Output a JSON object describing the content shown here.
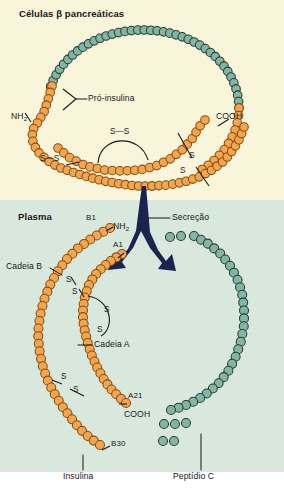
{
  "figure": {
    "type": "biology-diagram",
    "width": 284,
    "height": 494
  },
  "colors": {
    "panel_top_bg": "#f9f5da",
    "panel_bottom_bg": "#d9e8dc",
    "bead_orange_fill": "#f2a74e",
    "bead_orange_stroke": "#8a4b12",
    "bead_green_fill": "#7fb7a4",
    "bead_green_stroke": "#2f3a33",
    "arrow": "#1b2350",
    "text": "#17171a",
    "leader_line": "#17171a"
  },
  "panels": {
    "top": {
      "title": "Células β pancreáticas"
    },
    "bottom": {
      "title": "Plasma"
    }
  },
  "labels": {
    "proinsulin": "Pró-insulina",
    "nh2_top": "NH",
    "nh2_top_sub": "2",
    "cooh_top": "COOH",
    "ss_top_arc": "S—S",
    "ss_top_left": "S—S",
    "ss_top_diag_a": "S",
    "ss_top_diag_b": "S",
    "secretion": "Secreção",
    "b1": "B1",
    "nh2_bottom": "NH",
    "nh2_bottom_sub": "2",
    "a1": "A1",
    "chain_b": "Cadeia B",
    "chain_a": "Cadeia A",
    "a21": "A21",
    "cooh_bottom": "COOH",
    "b30": "B30",
    "insulin": "Insulina",
    "c_peptide": "Peptídio C",
    "ss_b_inter_a": "S",
    "ss_b_inter_b": "S",
    "ss_a_intra_a": "S",
    "ss_a_intra_b": "S",
    "ss_low_a": "S",
    "ss_low_b": "S"
  },
  "icons": {
    "secretion_arrow": "split-arrow-icon",
    "bead_chain": "peptide-bead-chain-icon"
  },
  "chart_data": {
    "type": "diagram",
    "regions": [
      {
        "name": "Células β pancreáticas",
        "contents": [
          "Pró-insulina"
        ]
      },
      {
        "name": "Plasma",
        "contents": [
          "Insulina",
          "Peptídio C"
        ]
      }
    ],
    "molecules": [
      {
        "name": "Pró-insulina",
        "termini": [
          "NH2",
          "COOH"
        ],
        "segments": [
          {
            "name": "C-peptide segment",
            "color": "green",
            "beads": 38
          },
          {
            "name": "A/B chain segment",
            "color": "orange",
            "beads": 54
          }
        ],
        "disulfide_bonds": 3
      },
      {
        "name": "Insulina",
        "color": "orange",
        "chains": [
          {
            "name": "Cadeia B",
            "start": "B1",
            "end": "B30",
            "terminus_start": "NH2"
          },
          {
            "name": "Cadeia A",
            "start": "A1",
            "end": "A21",
            "terminus_end": "COOH"
          }
        ],
        "disulfide_bonds": 3
      },
      {
        "name": "Peptídio C",
        "color": "green",
        "beads": 33
      }
    ]
  }
}
